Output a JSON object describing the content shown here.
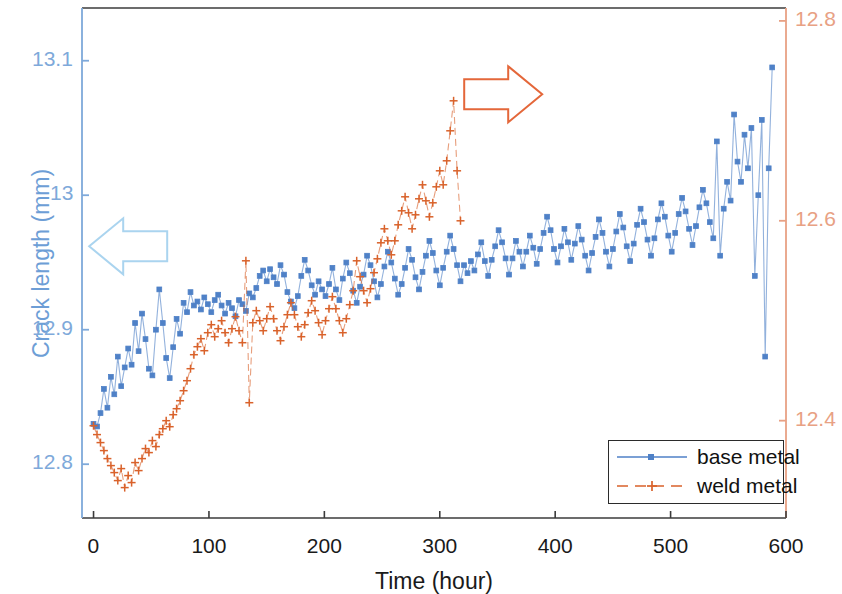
{
  "chart_data": {
    "type": "line",
    "title": "",
    "xlabel": "Time (hour)",
    "ylabel_left": "Crack length (mm)",
    "ylabel_right": "",
    "xlim": [
      -10,
      600
    ],
    "xticks": [
      0,
      100,
      200,
      300,
      400,
      500,
      600
    ],
    "xticklabels": [
      "0",
      "100",
      "200",
      "300",
      "400",
      "500",
      "600"
    ],
    "left_axis": {
      "color": "#6d9ed6",
      "ylim": [
        12.76,
        13.1392
      ],
      "yticks": [
        12.8,
        12.9,
        13.0,
        13.1
      ],
      "yticklabels": [
        "12.8",
        "12.9",
        "13",
        "13.1"
      ]
    },
    "right_axis": {
      "color": "#e08a63",
      "ylim": [
        12.3026,
        12.8129
      ],
      "yticks": [
        12.4,
        12.6,
        12.8
      ],
      "yticklabels": [
        "12.4",
        "12.6",
        "12.8"
      ]
    },
    "grid": false,
    "legend": {
      "position": "lower right",
      "entries": [
        {
          "label": "base metal",
          "color": "#4f81c7",
          "marker": "square",
          "linestyle": "solid",
          "axis": "left"
        },
        {
          "label": "weld metal",
          "color": "#d9622b",
          "marker": "plus",
          "linestyle": "dashed",
          "axis": "right"
        }
      ]
    },
    "annotations": [
      {
        "name": "left-arrow",
        "type": "arrow",
        "direction": "left",
        "color": "#aad4ef",
        "x_hour": 30,
        "y_mm": 12.962,
        "note": "points to left (blue) axis"
      },
      {
        "name": "right-arrow",
        "type": "arrow",
        "direction": "right",
        "color": "#e4673a",
        "x_hour": 355,
        "y_mm": 13.075,
        "note": "points to right (orange) axis"
      }
    ],
    "series": [
      {
        "name": "base metal",
        "axis": "left",
        "unit": "mm",
        "color": "#4f81c7",
        "x": [
          0,
          3,
          6,
          9,
          12,
          15,
          18,
          21,
          24,
          27,
          30,
          33,
          36,
          39,
          42,
          45,
          48,
          51,
          54,
          57,
          60,
          63,
          66,
          69,
          72,
          75,
          78,
          81,
          84,
          87,
          90,
          93,
          96,
          99,
          102,
          105,
          108,
          111,
          114,
          117,
          120,
          123,
          126,
          129,
          132,
          135,
          138,
          141,
          144,
          147,
          150,
          153,
          156,
          159,
          162,
          165,
          168,
          171,
          174,
          177,
          180,
          183,
          186,
          189,
          192,
          195,
          198,
          201,
          204,
          207,
          210,
          213,
          216,
          219,
          222,
          225,
          228,
          231,
          234,
          237,
          240,
          243,
          246,
          249,
          252,
          255,
          258,
          261,
          264,
          267,
          270,
          273,
          276,
          279,
          282,
          285,
          288,
          291,
          294,
          297,
          300,
          303,
          306,
          309,
          312,
          315,
          318,
          321,
          324,
          327,
          330,
          333,
          336,
          339,
          342,
          345,
          348,
          351,
          354,
          357,
          360,
          363,
          366,
          369,
          372,
          375,
          378,
          381,
          384,
          387,
          390,
          393,
          396,
          399,
          402,
          405,
          408,
          411,
          414,
          417,
          420,
          423,
          426,
          429,
          432,
          435,
          438,
          441,
          444,
          447,
          450,
          453,
          456,
          459,
          462,
          465,
          468,
          471,
          474,
          477,
          480,
          483,
          486,
          489,
          492,
          495,
          498,
          501,
          504,
          507,
          510,
          513,
          516,
          519,
          522,
          525,
          528,
          531,
          534,
          537,
          540,
          543,
          546,
          549,
          552,
          555,
          558,
          561,
          564,
          567,
          570,
          573,
          576,
          579,
          582,
          585,
          588
        ],
        "y": [
          12.83,
          12.828,
          12.838,
          12.856,
          12.842,
          12.865,
          12.852,
          12.88,
          12.858,
          12.872,
          12.886,
          12.874,
          12.905,
          12.884,
          12.912,
          12.893,
          12.871,
          12.866,
          12.9,
          12.93,
          12.905,
          12.879,
          12.864,
          12.887,
          12.908,
          12.897,
          12.92,
          12.913,
          12.928,
          12.918,
          12.921,
          12.915,
          12.924,
          12.919,
          12.913,
          12.922,
          12.926,
          12.918,
          12.912,
          12.92,
          12.916,
          12.91,
          12.922,
          12.919,
          12.914,
          12.927,
          12.924,
          12.931,
          12.94,
          12.944,
          12.936,
          12.945,
          12.939,
          12.934,
          12.948,
          12.941,
          12.928,
          12.921,
          12.916,
          12.925,
          12.94,
          12.952,
          12.944,
          12.933,
          12.926,
          12.936,
          12.93,
          12.925,
          12.934,
          12.946,
          12.93,
          12.922,
          12.938,
          12.95,
          12.942,
          12.929,
          12.92,
          12.932,
          12.941,
          12.955,
          12.948,
          12.936,
          12.924,
          12.934,
          12.947,
          12.958,
          12.95,
          12.938,
          12.926,
          12.934,
          12.946,
          12.96,
          12.952,
          12.939,
          12.93,
          12.943,
          12.955,
          12.966,
          12.957,
          12.944,
          12.933,
          12.946,
          12.958,
          12.97,
          12.96,
          12.948,
          12.936,
          12.948,
          12.942,
          12.951,
          12.944,
          12.956,
          12.965,
          12.951,
          12.94,
          12.952,
          12.962,
          12.974,
          12.965,
          12.953,
          12.941,
          12.953,
          12.966,
          12.958,
          12.947,
          12.958,
          12.97,
          12.961,
          12.949,
          12.96,
          12.972,
          12.984,
          12.974,
          12.96,
          12.95,
          12.962,
          12.975,
          12.965,
          12.952,
          12.964,
          12.977,
          12.967,
          12.955,
          12.944,
          12.957,
          12.969,
          12.982,
          12.972,
          12.958,
          12.947,
          12.96,
          12.973,
          12.986,
          12.976,
          12.962,
          12.951,
          12.964,
          12.978,
          12.99,
          12.98,
          12.967,
          12.955,
          12.968,
          12.982,
          12.994,
          12.984,
          12.97,
          12.958,
          12.972,
          12.986,
          12.998,
          12.988,
          12.975,
          12.963,
          12.977,
          12.991,
          13.004,
          12.994,
          12.98,
          12.968,
          13.04,
          12.955,
          12.99,
          13.01,
          12.996,
          13.06,
          13.025,
          13.01,
          13.045,
          13.02,
          13.05,
          12.94,
          13.0,
          13.056,
          12.88,
          13.02,
          13.095
        ]
      },
      {
        "name": "weld metal",
        "axis": "right",
        "unit": "mm",
        "color": "#d9622b",
        "x": [
          0,
          3,
          6,
          9,
          12,
          15,
          18,
          21,
          24,
          27,
          30,
          33,
          36,
          39,
          42,
          45,
          48,
          51,
          54,
          57,
          60,
          63,
          66,
          69,
          72,
          75,
          78,
          81,
          84,
          87,
          90,
          93,
          96,
          99,
          102,
          105,
          108,
          111,
          114,
          117,
          120,
          123,
          126,
          129,
          132,
          135,
          138,
          141,
          144,
          147,
          150,
          153,
          156,
          159,
          162,
          165,
          168,
          171,
          174,
          177,
          180,
          183,
          186,
          189,
          192,
          195,
          198,
          201,
          204,
          207,
          210,
          213,
          216,
          219,
          222,
          225,
          228,
          231,
          234,
          237,
          240,
          243,
          246,
          249,
          252,
          255,
          258,
          261,
          264,
          267,
          270,
          273,
          276,
          279,
          282,
          285,
          288,
          291,
          294,
          297,
          300,
          303,
          306,
          309,
          312,
          315,
          318
        ],
        "y": [
          12.395,
          12.386,
          12.378,
          12.37,
          12.362,
          12.355,
          12.348,
          12.34,
          12.352,
          12.333,
          12.345,
          12.338,
          12.358,
          12.35,
          12.362,
          12.372,
          12.368,
          12.38,
          12.374,
          12.386,
          12.392,
          12.4,
          12.394,
          12.406,
          12.412,
          12.42,
          12.43,
          12.44,
          12.452,
          12.466,
          12.474,
          12.482,
          12.47,
          12.488,
          12.496,
          12.484,
          12.492,
          12.5,
          12.488,
          12.478,
          12.492,
          12.504,
          12.49,
          12.478,
          12.56,
          12.418,
          12.498,
          12.51,
          12.5,
          12.49,
          12.502,
          12.514,
          12.502,
          12.49,
          12.48,
          12.494,
          12.506,
          12.518,
          12.506,
          12.494,
          12.484,
          12.496,
          12.508,
          12.52,
          12.51,
          12.498,
          12.486,
          12.5,
          12.512,
          12.524,
          12.512,
          12.5,
          12.488,
          12.502,
          12.516,
          12.53,
          12.56,
          12.544,
          12.53,
          12.518,
          12.532,
          12.548,
          12.562,
          12.578,
          12.592,
          12.58,
          12.566,
          12.58,
          12.596,
          12.61,
          12.624,
          12.608,
          12.592,
          12.606,
          12.622,
          12.636,
          12.62,
          12.604,
          12.618,
          12.634,
          12.65,
          12.636,
          12.66,
          12.69,
          12.72,
          12.65,
          12.6
        ]
      }
    ]
  },
  "axis_titles": {
    "x": "Time (hour)",
    "y_left": "Crack length (mm)"
  },
  "tick_text": {
    "x": [
      "0",
      "100",
      "200",
      "300",
      "400",
      "500",
      "600"
    ],
    "y_left": [
      "13.1",
      "13",
      "12.9",
      "12.8"
    ],
    "y_right": [
      "12.8",
      "12.6",
      "12.4"
    ]
  },
  "legend": {
    "base_metal": "base metal",
    "weld_metal": "weld metal"
  },
  "colors": {
    "base_metal": "#4f81c7",
    "weld_metal": "#d9622b",
    "left_axis": "#7ea9da",
    "right_axis": "#e8a184",
    "left_arrow": "#aad4ef",
    "right_arrow": "#e4673a",
    "frame": "#3b3b3b"
  }
}
